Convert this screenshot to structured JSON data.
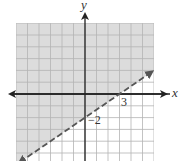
{
  "chart_data": {
    "type": "line",
    "title": "",
    "xlabel": "x",
    "ylabel": "y",
    "xlim": [
      -6,
      6
    ],
    "ylim": [
      -6,
      6
    ],
    "grid": true,
    "grid_step": 1,
    "series": [
      {
        "name": "boundary",
        "equation": "y = (2/3)x - 2",
        "style": "dashed",
        "arrows": "both",
        "x": [
          -6,
          0,
          3,
          6
        ],
        "y": [
          -6,
          -2,
          0,
          2
        ]
      }
    ],
    "shaded_region": {
      "inequality": "y > (2/3)x - 2",
      "side": "above"
    },
    "annotations": [
      {
        "text": "3",
        "x": 3,
        "y": 0
      },
      {
        "text": "−2",
        "x": 0,
        "y": -2
      }
    ]
  },
  "labels": {
    "x_axis": "x",
    "y_axis": "y",
    "x_intercept": "3",
    "y_intercept": "−2"
  },
  "colors": {
    "shade": "#dcdcdc",
    "grid_shaded": "#b4b4b4",
    "grid_plain": "#c8c8c8",
    "axis": "#222222",
    "line": "#555555"
  }
}
